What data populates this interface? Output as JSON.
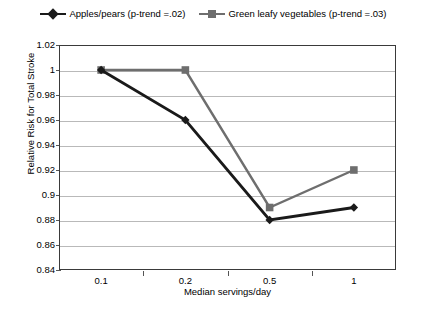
{
  "chart_data": {
    "type": "line",
    "title": "",
    "xlabel": "Median servings/day",
    "ylabel": "Relative Risk for  Total Stroke",
    "categories": [
      "0.1",
      "0.2",
      "0.5",
      "1"
    ],
    "ylim": [
      0.84,
      1.02
    ],
    "ytick_step": 0.02,
    "yticks": [
      "1.02",
      "1",
      "0.98",
      "0.96",
      "0.94",
      "0.92",
      "0.9",
      "0.88",
      "0.86",
      "0.84"
    ],
    "ytick_values": [
      1.02,
      1.0,
      0.98,
      0.96,
      0.94,
      0.92,
      0.9,
      0.88,
      0.86,
      0.84
    ],
    "grid": "horizontal",
    "legend_position": "top-center",
    "series": [
      {
        "name": "Apples/pears (p-trend =.02)",
        "values": [
          1.0,
          0.96,
          0.88,
          0.89
        ],
        "color": "#1a1a1a",
        "marker": "diamond"
      },
      {
        "name": "Green leafy vegetables (p-trend =.03)",
        "values": [
          1.0,
          1.0,
          0.89,
          0.92
        ],
        "color": "#6e6e6e",
        "marker": "square"
      }
    ]
  },
  "legend": {
    "items": [
      {
        "label": "Apples/pears (p-trend =.02)",
        "marker": "diamond-marker",
        "color": "#1a1a1a"
      },
      {
        "label": "Green leafy vegetables (p-trend =.03)",
        "marker": "square-marker",
        "color": "#6e6e6e"
      }
    ]
  },
  "axes": {
    "y_title": "Relative Risk for  Total Stroke",
    "x_title": "Median servings/day"
  }
}
